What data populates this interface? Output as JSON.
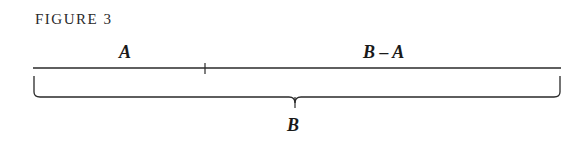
{
  "figure": {
    "caption": "FIGURE 3",
    "segment_labels": {
      "left": "A",
      "right": "B – A"
    },
    "brace_label": "B"
  }
}
